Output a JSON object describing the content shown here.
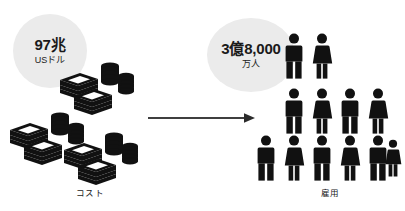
{
  "infographic": {
    "background_color": "#ffffff",
    "ink_color": "#111111",
    "bubble_fill": "#ebebeb",
    "left": {
      "bubble": {
        "value": "97兆",
        "unit": "USドル"
      },
      "caption": "コスト",
      "icon": "money-stack-icon",
      "clusters": 3,
      "notes_per_cluster": 2,
      "coin_stacks_per_cluster": 2
    },
    "arrow": {
      "icon": "right-arrow-icon",
      "direction": "right",
      "color": "#2b2b2b"
    },
    "right": {
      "bubble": {
        "value": "3億8,000",
        "unit": "万人"
      },
      "caption": "雇用",
      "icon": "people-group-icon",
      "people_rows": [
        {
          "count": 2,
          "genders": [
            "male",
            "female"
          ]
        },
        {
          "count": 4,
          "genders": [
            "male",
            "female",
            "male",
            "female"
          ]
        },
        {
          "count": 6,
          "genders": [
            "male",
            "female",
            "male",
            "female",
            "male",
            "female"
          ]
        }
      ],
      "total_people": 12
    }
  }
}
